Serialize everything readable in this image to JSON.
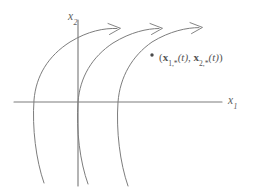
{
  "figure": {
    "kind": "phase-plane-diagram",
    "background_color": "#ffffff",
    "line_color": "#7d7d7d",
    "text_color": "#5d5d5d",
    "width": 254,
    "height": 196,
    "axes": {
      "x_axis_label": "x",
      "x_axis_subscript": "1",
      "y_axis_label": "x",
      "y_axis_subscript": "2",
      "origin": {
        "x": 78,
        "y": 102
      },
      "x_axis_start": {
        "x": 14,
        "y": 102
      },
      "x_axis_end": {
        "x": 222,
        "y": 102
      },
      "y_axis_start": {
        "x": 78,
        "y": 20
      },
      "y_axis_end": {
        "x": 78,
        "y": 186
      }
    },
    "point_label": {
      "open_paren": "(",
      "first_symbol": "x",
      "first_subscript": "1,*",
      "first_argument": "(t)",
      "separator": ", ",
      "second_symbol": "x",
      "second_subscript": "2,*",
      "second_argument": "(t)",
      "close_paren": ")",
      "full_text": "(x1,*(t), x2,*(t))",
      "marker": {
        "x": 152,
        "y": 55,
        "radius": 1.7
      }
    },
    "curves": [
      {
        "name": "trajectory-left",
        "vertex": {
          "x": 34,
          "y": 100
        },
        "x_axis_crossing": 34,
        "has_arrowhead": true,
        "arrow_tip": {
          "x": 120,
          "y": 28
        }
      },
      {
        "name": "trajectory-middle",
        "vertex": {
          "x": 78,
          "y": 102
        },
        "x_axis_crossing": 78,
        "has_arrowhead": true,
        "arrow_tip": {
          "x": 162,
          "y": 28
        }
      },
      {
        "name": "trajectory-right",
        "vertex": {
          "x": 118,
          "y": 102
        },
        "x_axis_crossing": 118,
        "has_arrowhead": true,
        "arrow_tip": {
          "x": 202,
          "y": 27
        }
      }
    ]
  }
}
